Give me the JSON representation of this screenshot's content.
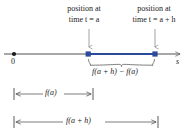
{
  "figure": {
    "title_hidden": "Number line showing position at time t = a and t = a + h",
    "colors": {
      "axis": "#8a8a8a",
      "segment": "#2a4b9b",
      "text": "#1a1a1a",
      "leader": "#8a8a8a"
    }
  },
  "callouts": {
    "left": {
      "line1": "position at",
      "line2": "time t = a"
    },
    "right": {
      "line1": "position at",
      "line2": "time t = a + h"
    }
  },
  "axis": {
    "origin_label": "0",
    "variable_label": "s",
    "origin_x": 14,
    "y": 54,
    "start_x": 4,
    "end_x": 184,
    "arrow_label_x": 177
  },
  "segment": {
    "label": "f(a + h) − f(a)",
    "start_x": 88,
    "end_x": 155,
    "color": "#2a4b9b"
  },
  "measures": [
    {
      "name": "f-of-a",
      "label": "f(a)",
      "start_x": 14,
      "end_x": 93,
      "y": 94
    },
    {
      "name": "f-of-a-plus-h",
      "label": "f(a + h)",
      "start_x": 14,
      "end_x": 158,
      "y": 122
    }
  ]
}
